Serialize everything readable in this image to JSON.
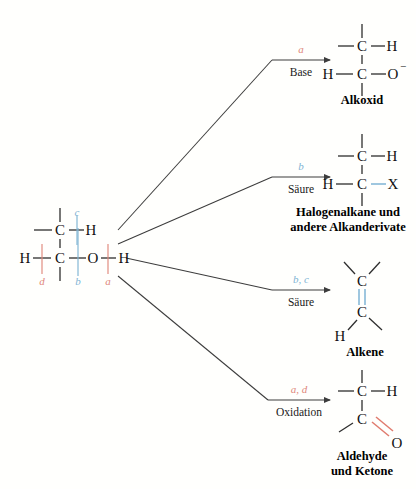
{
  "diagram": {
    "background_color": "#fffffd",
    "colors": {
      "red": "#e0887c",
      "blue": "#7fb4d4",
      "line": "#3c3c3c",
      "text": "#111111"
    }
  },
  "reactant": {
    "name": "alcohol-substrate",
    "atoms": {
      "top_carbon": "C",
      "top_hydrogen": "H",
      "left_hydrogen": "H",
      "bottom_carbon": "C",
      "oxygen": "O",
      "hydroxyl_hydrogen": "H"
    },
    "bond_labels": [
      {
        "id": "c",
        "letter": "c",
        "color": "blue"
      },
      {
        "id": "d",
        "letter": "d",
        "color": "red"
      },
      {
        "id": "b",
        "letter": "b",
        "color": "blue"
      },
      {
        "id": "a",
        "letter": "a",
        "color": "red"
      }
    ]
  },
  "branches": [
    {
      "id": "alkoxide",
      "letters": "a",
      "letters_color": "red",
      "condition": "Base",
      "product_name": "Alkoxid",
      "product_name_lines": [
        "Alkoxid"
      ],
      "atoms": {
        "top_carbon": "C",
        "top_hydrogen": "H",
        "left_hydrogen": "H",
        "bottom_carbon": "C",
        "oxygen": "O"
      },
      "charge": "−"
    },
    {
      "id": "haloalkane",
      "letters": "b",
      "letters_color": "blue",
      "condition": "Säure",
      "product_name": "Halogenalkane und andere Alkanderivate",
      "product_name_lines": [
        "Halogenalkane und",
        "andere Alkanderivate"
      ],
      "atoms": {
        "top_carbon": "C",
        "top_hydrogen": "H",
        "left_hydrogen": "H",
        "bottom_carbon": "C",
        "halogen": "X"
      }
    },
    {
      "id": "alkene",
      "letters": "b, c",
      "letters_color": "blue",
      "condition": "Säure",
      "product_name": "Alkene",
      "product_name_lines": [
        "Alkene"
      ],
      "atoms": {
        "top_carbon": "C",
        "bottom_carbon": "C",
        "hydrogen": "H"
      },
      "bond_type": "double-bond-blue"
    },
    {
      "id": "carbonyl",
      "letters": "a, d",
      "letters_color": "red",
      "condition": "Oxidation",
      "product_name": "Aldehyde und Ketone",
      "product_name_lines": [
        "Aldehyde",
        "und Ketone"
      ],
      "atoms": {
        "top_carbon": "C",
        "top_hydrogen": "H",
        "bottom_carbon": "C",
        "oxygen": "O"
      },
      "bond_type": "double-bond-red"
    }
  ]
}
